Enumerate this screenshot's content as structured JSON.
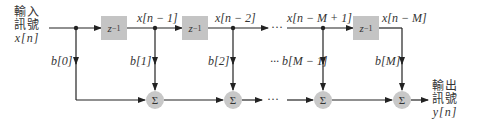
{
  "input": {
    "line1": "輸入",
    "line2": "訊號",
    "signal": "x[n]"
  },
  "output": {
    "line1": "輸出",
    "line2": "訊號",
    "signal": "y[n]"
  },
  "delay_label": "z",
  "delay_exp": "−1",
  "sum_symbol": "Σ",
  "ellipsis": "···",
  "taps": [
    {
      "signal": "x[n − 1]",
      "coef": "b[1]"
    },
    {
      "signal": "x[n − 2]",
      "coef": "b[2]"
    },
    {
      "signal": "x[n − M + 1]",
      "coef": "b[M − 1]"
    },
    {
      "signal": "x[n − M]",
      "coef": "b[M]"
    }
  ],
  "coef0": "b[0]",
  "colors": {
    "line": "#222222",
    "box": "#c4c4c4",
    "sum": "#c8c8c8"
  }
}
